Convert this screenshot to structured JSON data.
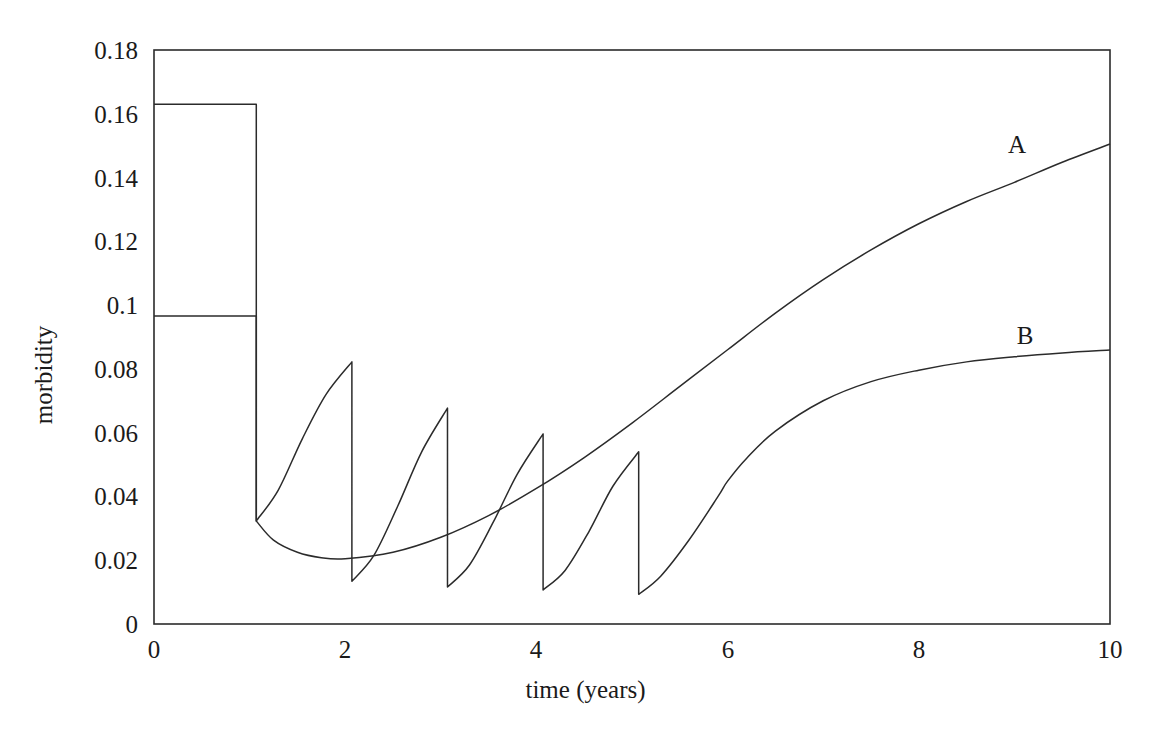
{
  "chart_data": {
    "type": "line",
    "title": "",
    "xlabel": "time (years)",
    "ylabel": "morbidity",
    "xlim": [
      0,
      10
    ],
    "ylim": [
      0,
      0.18
    ],
    "grid": false,
    "legend_position": "inline-end-of-curve",
    "xticks": [
      "0",
      "2",
      "4",
      "6",
      "8",
      "10"
    ],
    "xtick_values": [
      0,
      2,
      4,
      6,
      8,
      10
    ],
    "yticks": [
      "0",
      "0.02",
      "0.04",
      "0.06",
      "0.08",
      "0.1",
      "0.12",
      "0.14",
      "0.16",
      "0.18"
    ],
    "ytick_values": [
      0,
      0.02,
      0.04,
      0.06,
      0.08,
      0.1,
      0.12,
      0.14,
      0.16,
      0.18
    ],
    "annotations": [
      {
        "text": "A",
        "x": 9.0,
        "y": 0.1425
      },
      {
        "text": "B",
        "x": 9.0,
        "y": 0.0905
      }
    ],
    "series": [
      {
        "name": "A",
        "label": "A",
        "color": "#2b2b2b",
        "description": "Upper curve: constant 0.163 until treatment at t=1.07, drops to 0.0323, then rises back toward 0.1505 at t=10",
        "points": [
          [
            0.0,
            0.163
          ],
          [
            1.07,
            0.163
          ],
          [
            1.07,
            0.0323
          ],
          [
            1.25,
            0.0263
          ],
          [
            1.5,
            0.0225
          ],
          [
            1.75,
            0.0208
          ],
          [
            2.0,
            0.0205
          ],
          [
            2.5,
            0.0225
          ],
          [
            3.0,
            0.0272
          ],
          [
            3.5,
            0.034
          ],
          [
            4.0,
            0.0425
          ],
          [
            4.5,
            0.0522
          ],
          [
            5.0,
            0.063
          ],
          [
            5.5,
            0.0745
          ],
          [
            6.0,
            0.086
          ],
          [
            6.5,
            0.0975
          ],
          [
            7.0,
            0.108
          ],
          [
            7.5,
            0.1173
          ],
          [
            8.0,
            0.1255
          ],
          [
            8.5,
            0.1325
          ],
          [
            9.0,
            0.1385
          ],
          [
            9.5,
            0.1448
          ],
          [
            10.0,
            0.1505
          ]
        ]
      },
      {
        "name": "B",
        "label": "B",
        "color": "#2b2b2b",
        "description": "Lower sawtooth curve: constant 0.0966 until t=1.07, then annual treatment drops at t=1.07,2.07,3.07,4.07,5.07 with regrowth between; after t=5 it recovers to 0.0859 at t=10",
        "treatment_times": [
          1.07,
          2.07,
          3.07,
          4.07,
          5.07
        ],
        "peaks": [
          {
            "t": 0.0,
            "y": 0.0966
          },
          {
            "t": 2.07,
            "y": 0.0822
          },
          {
            "t": 3.07,
            "y": 0.0677
          },
          {
            "t": 4.07,
            "y": 0.0596
          },
          {
            "t": 5.07,
            "y": 0.054
          }
        ],
        "post_drop_values": [
          0.0323,
          0.0134,
          0.0116,
          0.0107,
          0.0093
        ],
        "points": [
          [
            0.0,
            0.0966
          ],
          [
            1.07,
            0.0966
          ],
          [
            1.07,
            0.0323
          ],
          [
            1.3,
            0.042
          ],
          [
            1.55,
            0.058
          ],
          [
            1.8,
            0.072
          ],
          [
            2.07,
            0.0822
          ],
          [
            2.07,
            0.0134
          ],
          [
            2.3,
            0.0215
          ],
          [
            2.55,
            0.037
          ],
          [
            2.8,
            0.054
          ],
          [
            3.07,
            0.0677
          ],
          [
            3.07,
            0.0116
          ],
          [
            3.3,
            0.0185
          ],
          [
            3.55,
            0.032
          ],
          [
            3.8,
            0.047
          ],
          [
            4.07,
            0.0596
          ],
          [
            4.07,
            0.0107
          ],
          [
            4.3,
            0.0168
          ],
          [
            4.55,
            0.029
          ],
          [
            4.8,
            0.0432
          ],
          [
            5.07,
            0.054
          ],
          [
            5.07,
            0.0093
          ],
          [
            5.3,
            0.015
          ],
          [
            5.6,
            0.0265
          ],
          [
            5.9,
            0.04
          ],
          [
            6.0,
            0.0448
          ],
          [
            6.2,
            0.052
          ],
          [
            6.5,
            0.0605
          ],
          [
            7.0,
            0.07
          ],
          [
            7.5,
            0.076
          ],
          [
            8.0,
            0.0796
          ],
          [
            8.5,
            0.0822
          ],
          [
            9.0,
            0.0838
          ],
          [
            9.5,
            0.085
          ],
          [
            10.0,
            0.0859
          ]
        ]
      }
    ],
    "envelope_after_last_treatment": {
      "description": "Upper envelope of the sawtooth (curve B) decays from 0.0966 to a minimum near 0.0487 at t=5.75 then rises to 0.0859 at t=10",
      "min_point": {
        "t": 5.75,
        "y": 0.0487
      },
      "crossing_point": {
        "t": 6.02,
        "y": 0.0508
      }
    }
  }
}
